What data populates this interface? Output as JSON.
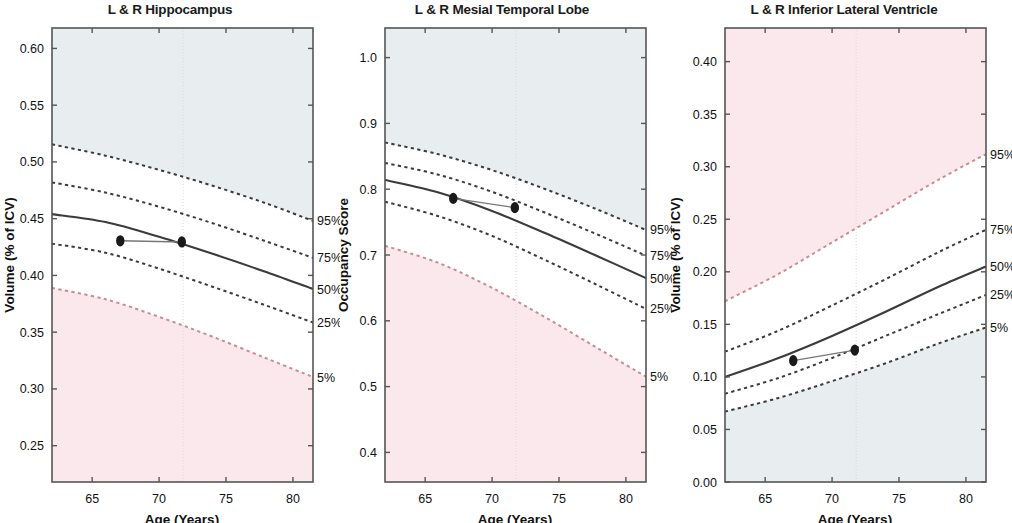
{
  "figure": {
    "width": 1012,
    "height": 523,
    "background": "#ffffff",
    "common_xlabel": "Age (Years)",
    "percentile_labels": [
      "95%",
      "75%",
      "50%",
      "25%",
      "5%"
    ],
    "colors": {
      "normal_band_white": "#ffffff",
      "upper_shade_blue": "#e8eef0",
      "lower_shade_pink": "#fbe8ec",
      "median_line": "#3b3b3b",
      "quartile_line": "#3b3b3b",
      "extreme_line_pink": "#c98c96",
      "marker": "#1a1a1a",
      "axis": "#555555",
      "gridline": "#ddd9da"
    }
  },
  "chart_data": [
    {
      "type": "line",
      "panel_index": 0,
      "title": "L & R Hippocampus",
      "xlabel": "Age (Years)",
      "ylabel": "Volume (% of ICV)",
      "xlim": [
        62,
        81.5
      ],
      "ylim": [
        0.218,
        0.618
      ],
      "xticks": [
        65,
        70,
        75,
        80
      ],
      "xtick_labels": [
        "65",
        "70",
        "75",
        "80"
      ],
      "yticks": [
        0.25,
        0.3,
        0.35,
        0.4,
        0.45,
        0.5,
        0.55,
        0.6
      ],
      "ytick_labels": [
        "0.25",
        "0.30",
        "0.35",
        "0.40",
        "0.45",
        "0.50",
        "0.55",
        "0.60"
      ],
      "grid": false,
      "vertical_marker_age": 71.8,
      "legend_position": "right-outside",
      "series": [
        {
          "name": "95%",
          "style": "dashed",
          "color": "#3b3b3b",
          "x": [
            62,
            66,
            70,
            74,
            78,
            81.5
          ],
          "values": [
            0.5155,
            0.5055,
            0.493,
            0.479,
            0.4635,
            0.448
          ]
        },
        {
          "name": "75%",
          "style": "dashed",
          "color": "#3b3b3b",
          "x": [
            62,
            66,
            70,
            74,
            78,
            81.5
          ],
          "values": [
            0.482,
            0.473,
            0.4605,
            0.446,
            0.43,
            0.4155
          ]
        },
        {
          "name": "50%",
          "style": "solid",
          "color": "#3b3b3b",
          "x": [
            62,
            66,
            70,
            74,
            78,
            81.5
          ],
          "values": [
            0.454,
            0.447,
            0.434,
            0.419,
            0.403,
            0.388
          ]
        },
        {
          "name": "25%",
          "style": "dashed",
          "color": "#3b3b3b",
          "x": [
            62,
            66,
            70,
            74,
            78,
            81.5
          ],
          "values": [
            0.428,
            0.42,
            0.406,
            0.39,
            0.3735,
            0.3585
          ]
        },
        {
          "name": "5%",
          "style": "dashed",
          "color": "#c98c96",
          "x": [
            62,
            66,
            70,
            74,
            78,
            81.5
          ],
          "values": [
            0.389,
            0.379,
            0.3635,
            0.346,
            0.327,
            0.3105
          ]
        },
        {
          "name": "subject",
          "style": "markers-line",
          "color": "#1a1a1a",
          "x": [
            67.1,
            71.7
          ],
          "values": [
            0.4305,
            0.4295
          ]
        }
      ]
    },
    {
      "type": "line",
      "panel_index": 1,
      "title": "L & R Mesial Temporal Lobe",
      "xlabel": "Age (Years)",
      "ylabel": "Occupancy Score",
      "xlim": [
        62,
        81.5
      ],
      "ylim": [
        0.355,
        1.045
      ],
      "xticks": [
        65,
        70,
        75,
        80
      ],
      "xtick_labels": [
        "65",
        "70",
        "75",
        "80"
      ],
      "yticks": [
        0.4,
        0.5,
        0.6,
        0.7,
        0.8,
        0.9,
        1.0
      ],
      "ytick_labels": [
        "0.4",
        "0.5",
        "0.6",
        "0.7",
        "0.8",
        "0.9",
        "1.0"
      ],
      "grid": false,
      "vertical_marker_age": 71.8,
      "legend_position": "right-outside",
      "series": [
        {
          "name": "95%",
          "style": "dashed",
          "color": "#3b3b3b",
          "x": [
            62,
            66,
            70,
            74,
            78,
            81.5
          ],
          "values": [
            0.871,
            0.853,
            0.829,
            0.8,
            0.768,
            0.738
          ]
        },
        {
          "name": "75%",
          "style": "dashed",
          "color": "#3b3b3b",
          "x": [
            62,
            66,
            70,
            74,
            78,
            81.5
          ],
          "values": [
            0.84,
            0.822,
            0.796,
            0.764,
            0.73,
            0.699
          ]
        },
        {
          "name": "50%",
          "style": "solid",
          "color": "#3b3b3b",
          "x": [
            62,
            66,
            70,
            74,
            78,
            81.5
          ],
          "values": [
            0.814,
            0.795,
            0.767,
            0.733,
            0.697,
            0.665
          ]
        },
        {
          "name": "25%",
          "style": "dashed",
          "color": "#3b3b3b",
          "x": [
            62,
            66,
            70,
            74,
            78,
            81.5
          ],
          "values": [
            0.781,
            0.759,
            0.729,
            0.692,
            0.653,
            0.618
          ]
        },
        {
          "name": "5%",
          "style": "dashed",
          "color": "#c98c96",
          "x": [
            62,
            66,
            70,
            74,
            78,
            81.5
          ],
          "values": [
            0.714,
            0.688,
            0.65,
            0.605,
            0.557,
            0.515
          ]
        },
        {
          "name": "subject",
          "style": "markers-line",
          "color": "#1a1a1a",
          "x": [
            67.1,
            71.7
          ],
          "values": [
            0.786,
            0.772
          ]
        }
      ]
    },
    {
      "type": "line",
      "panel_index": 2,
      "title": "L & R Inferior Lateral Ventricle",
      "xlabel": "Age (Years)",
      "ylabel": "Volume (% of ICV)",
      "xlim": [
        62,
        81.5
      ],
      "ylim": [
        0.0,
        0.432
      ],
      "xticks": [
        65,
        70,
        75,
        80
      ],
      "xtick_labels": [
        "65",
        "70",
        "75",
        "80"
      ],
      "yticks": [
        0.0,
        0.05,
        0.1,
        0.15,
        0.2,
        0.25,
        0.3,
        0.35,
        0.4
      ],
      "ytick_labels": [
        "0.00",
        "0.05",
        "0.10",
        "0.15",
        "0.20",
        "0.25",
        "0.30",
        "0.35",
        "0.40"
      ],
      "grid": false,
      "vertical_marker_age": 71.8,
      "legend_position": "right-outside",
      "series": [
        {
          "name": "95%",
          "style": "dashed",
          "color": "#c98c96",
          "x": [
            62,
            66,
            70,
            74,
            78,
            81.5
          ],
          "values": [
            0.172,
            0.198,
            0.228,
            0.258,
            0.288,
            0.312
          ]
        },
        {
          "name": "75%",
          "style": "dashed",
          "color": "#3b3b3b",
          "x": [
            62,
            66,
            70,
            74,
            78,
            81.5
          ],
          "values": [
            0.124,
            0.144,
            0.168,
            0.193,
            0.219,
            0.24
          ]
        },
        {
          "name": "50%",
          "style": "solid",
          "color": "#3b3b3b",
          "x": [
            62,
            66,
            70,
            74,
            78,
            81.5
          ],
          "values": [
            0.1,
            0.118,
            0.139,
            0.162,
            0.186,
            0.205
          ]
        },
        {
          "name": "25%",
          "style": "dashed",
          "color": "#3b3b3b",
          "x": [
            62,
            66,
            70,
            74,
            78,
            81.5
          ],
          "values": [
            0.084,
            0.099,
            0.118,
            0.139,
            0.16,
            0.178
          ]
        },
        {
          "name": "5%",
          "style": "dashed",
          "color": "#3b3b3b",
          "x": [
            62,
            66,
            70,
            74,
            78,
            81.5
          ],
          "values": [
            0.067,
            0.08,
            0.096,
            0.113,
            0.132,
            0.147
          ]
        },
        {
          "name": "subject",
          "style": "markers-line",
          "color": "#1a1a1a",
          "x": [
            67.1,
            71.7
          ],
          "values": [
            0.1155,
            0.1255
          ]
        }
      ]
    }
  ]
}
